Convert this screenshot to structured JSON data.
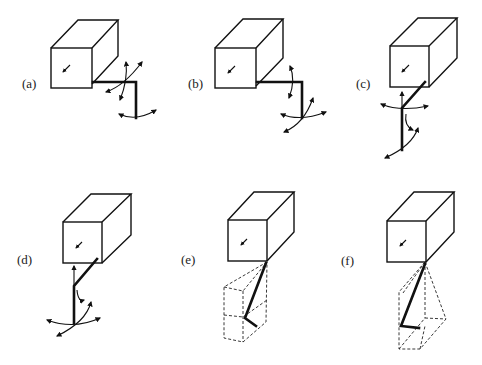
{
  "figure": {
    "panels": [
      {
        "id": "a",
        "label": "(a)",
        "description": "Cube with jointed arm bending right then down; rotation arrows at elbow and end"
      },
      {
        "id": "b",
        "label": "(b)",
        "description": "Cube with jointed arm right then down; vertical rotation arrows mid-segment and fan of arrows at end"
      },
      {
        "id": "c",
        "label": "(c)",
        "description": "Cube with diagonal arm then vertical segment down; rotation arrows at joint and below"
      },
      {
        "id": "d",
        "label": "(d)",
        "description": "Cube with diagonal arm then vertical segment down; rotation arrows at joint and at end"
      },
      {
        "id": "e",
        "label": "(e)",
        "description": "Cube with arm angled down to a dashed prism workspace"
      },
      {
        "id": "f",
        "label": "(f)",
        "description": "Cube with arm angled down to a dashed pyramidal workspace"
      }
    ]
  }
}
